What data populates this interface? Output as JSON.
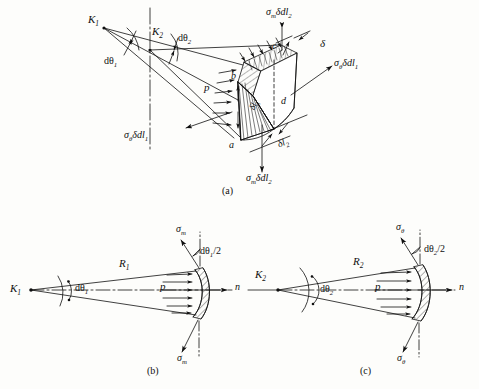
{
  "figure": {
    "ink_color": "#101010",
    "background_color": "#fdfdfb"
  },
  "captions": {
    "a": "(a)",
    "b": "(b)",
    "c": "(c)"
  },
  "panel_a": {
    "center_k1": "K",
    "center_k1_sub": "1",
    "center_k2": "K",
    "center_k2_sub": "2",
    "angle_1": "dθ",
    "angle_1_sub": "1",
    "angle_2": "dθ",
    "angle_2_sub": "2",
    "pressure": "p",
    "thickness": "δ",
    "force_meridional_top": "σ",
    "force_meridional_top_sub": "m",
    "force_meridional_top_rest": "δdl",
    "force_meridional_top_rest_sub": "2",
    "force_meridional_bottom": "σ",
    "force_meridional_bottom_sub": "m",
    "force_meridional_bottom_rest": "δdl",
    "force_meridional_bottom_rest_sub": "2",
    "force_hoop_right": "σ",
    "force_hoop_right_sub": "θ",
    "force_hoop_right_rest": "δdl",
    "force_hoop_right_rest_sub": "1",
    "force_hoop_left": "σ",
    "force_hoop_left_sub": "θ",
    "force_hoop_left_rest": "δdl",
    "force_hoop_left_rest_sub": "1",
    "arc_len_1": "δl",
    "arc_len_1_sub": "1",
    "arc_len_2": "δl",
    "arc_len_2_sub": "2",
    "vertex_a": "a",
    "vertex_b": "b",
    "vertex_c": "c",
    "vertex_d": "d"
  },
  "panel_b": {
    "center": "K",
    "center_sub": "1",
    "radius": "R",
    "radius_sub": "1",
    "angle": "dθ",
    "angle_sub": "1",
    "half_angle": "dθ",
    "half_angle_sub": "1",
    "half_angle_rest": "/2",
    "pressure": "p",
    "stress_top": "σ",
    "stress_top_sub": "m",
    "stress_bottom": "σ",
    "stress_bottom_sub": "m",
    "axis": "n"
  },
  "panel_c": {
    "center": "K",
    "center_sub": "2",
    "radius": "R",
    "radius_sub": "2",
    "angle": "dθ",
    "angle_sub": "2",
    "half_angle": "dθ",
    "half_angle_sub": "2",
    "half_angle_rest": "/2",
    "pressure": "p",
    "stress_top": "σ",
    "stress_top_sub": "θ",
    "stress_bottom": "σ",
    "stress_bottom_sub": "θ",
    "axis": "n"
  }
}
